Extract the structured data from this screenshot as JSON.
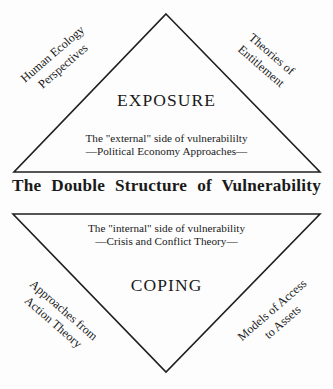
{
  "figure": {
    "center_title": "The Double Structure of Vulnerability",
    "upper": {
      "heading": "EXPOSURE",
      "sub_line1": "The \"external\" side of vulnerabililty",
      "sub_line2": "—Political Economy Approaches—",
      "left_caption_line1": "Human Ecology",
      "left_caption_line2": "Perspectives",
      "right_caption_line1": "Theories of",
      "right_caption_line2": "Entitlement"
    },
    "lower": {
      "heading": "COPING",
      "sub_line1": "The \"internal\" side of vulnerability",
      "sub_line2": "—Crisis and Conflict Theory—",
      "left_caption_line1": "Approaches from",
      "left_caption_line2": "Action Theory",
      "right_caption_line1": "Models of Access",
      "right_caption_line2": "to Assets"
    }
  },
  "style": {
    "stroke": "#1f1f1f",
    "text": "#1a1a1a",
    "background": "#fdfdfd"
  }
}
